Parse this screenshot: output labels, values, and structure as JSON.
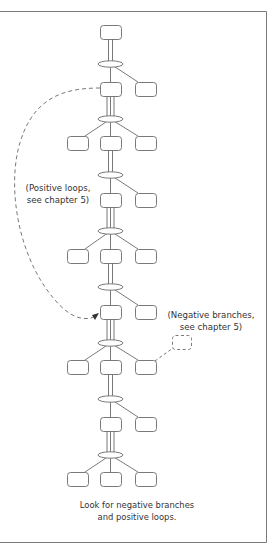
{
  "figure": {
    "frame_color": "#7a7a7a",
    "line_color": "#6a6a6a",
    "text_color": "#333333"
  },
  "annotations": {
    "positive_loops": {
      "line1": "(Positive loops,",
      "line2": "see chapter 5)"
    },
    "negative_branches": {
      "line1": "(Negative branches,",
      "line2": "see chapter 5)"
    }
  },
  "caption": {
    "line1": "Look for negative branches",
    "line2": "and positive loops."
  },
  "tree": {
    "levels": [
      {
        "y": 25,
        "boxes": [
          "center"
        ]
      },
      {
        "y": 82,
        "boxes": [
          "center",
          "right"
        ]
      },
      {
        "y": 136,
        "boxes": [
          "left",
          "center",
          "right"
        ]
      },
      {
        "y": 193,
        "boxes": [
          "center",
          "right"
        ]
      },
      {
        "y": 249,
        "boxes": [
          "left",
          "center",
          "right"
        ]
      },
      {
        "y": 305,
        "boxes": [
          "center",
          "right"
        ]
      },
      {
        "y": 360,
        "boxes": [
          "left",
          "center",
          "right"
        ]
      },
      {
        "y": 417,
        "boxes": [
          "center",
          "right"
        ]
      },
      {
        "y": 472,
        "boxes": [
          "left",
          "center",
          "right"
        ]
      }
    ]
  }
}
